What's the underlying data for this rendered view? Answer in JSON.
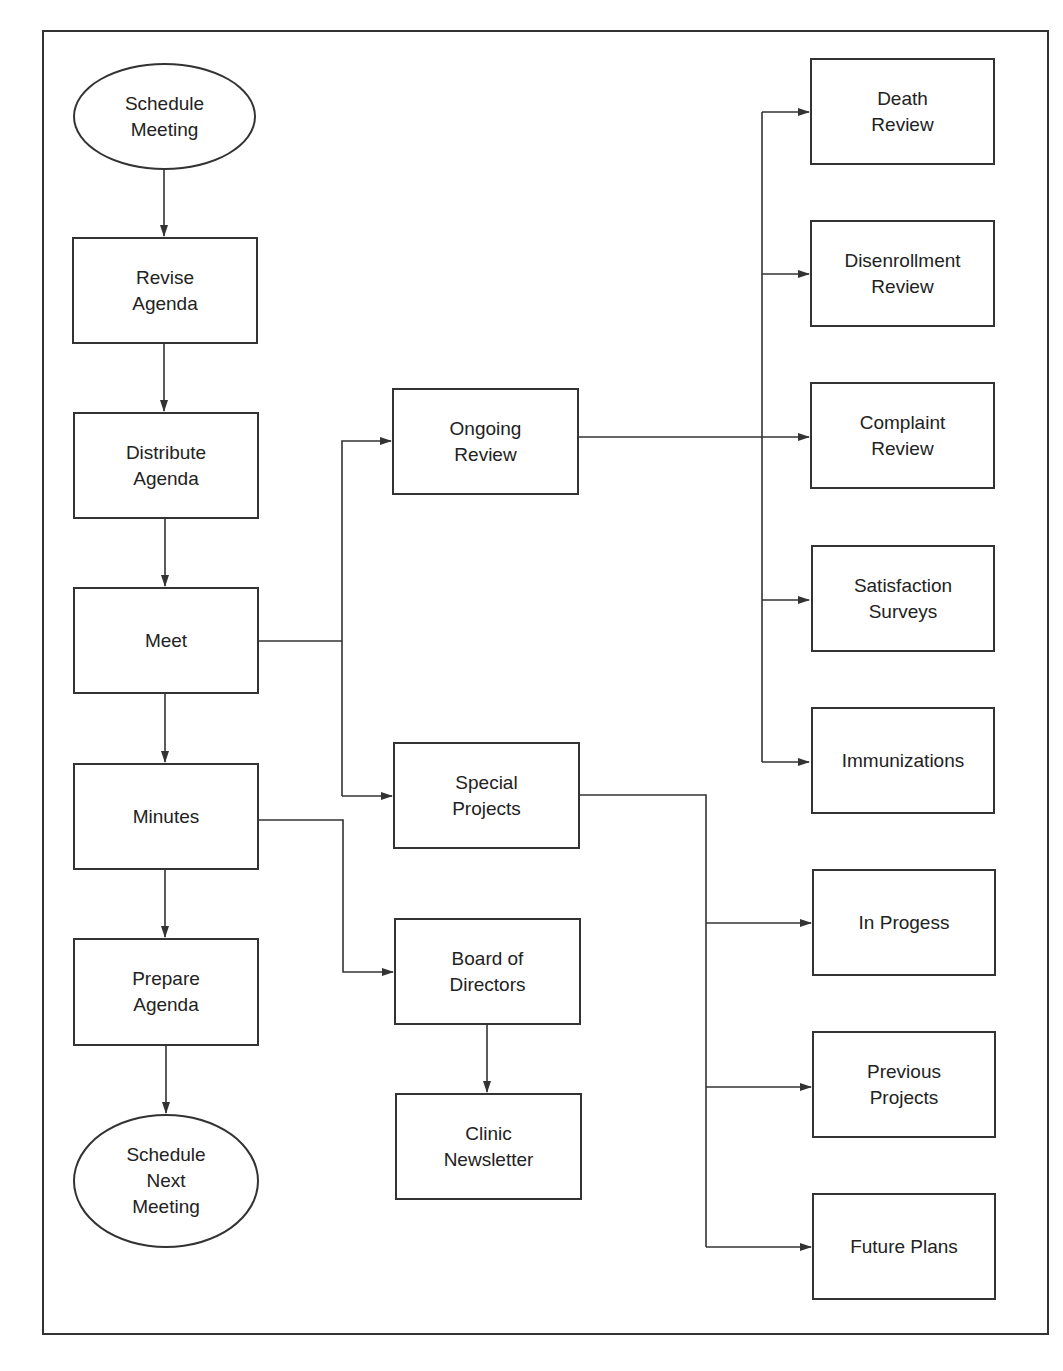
{
  "diagram": {
    "type": "flowchart",
    "nodes": {
      "schedule_meeting": "Schedule\nMeeting",
      "revise_agenda": "Revise\nAgenda",
      "distribute_agenda": "Distribute\nAgenda",
      "meet": "Meet",
      "minutes": "Minutes",
      "prepare_agenda": "Prepare\nAgenda",
      "schedule_next_meeting": "Schedule\nNext\nMeeting",
      "ongoing_review": "Ongoing\nReview",
      "special_projects": "Special\nProjects",
      "board_of_directors": "Board of\nDirectors",
      "clinic_newsletter": "Clinic\nNewsletter",
      "death_review": "Death\nReview",
      "disenrollment_review": "Disenrollment\nReview",
      "complaint_review": "Complaint\nReview",
      "satisfaction_surveys": "Satisfaction\nSurveys",
      "immunizations": "Immunizations",
      "in_progess": "In Progess",
      "previous_projects": "Previous\nProjects",
      "future_plans": "Future Plans"
    },
    "edges": [
      [
        "Schedule Meeting",
        "Revise Agenda"
      ],
      [
        "Revise Agenda",
        "Distribute Agenda"
      ],
      [
        "Distribute Agenda",
        "Meet"
      ],
      [
        "Meet",
        "Minutes"
      ],
      [
        "Minutes",
        "Prepare Agenda"
      ],
      [
        "Prepare Agenda",
        "Schedule Next Meeting"
      ],
      [
        "Meet",
        "Ongoing Review"
      ],
      [
        "Meet",
        "Special Projects"
      ],
      [
        "Minutes",
        "Board of Directors"
      ],
      [
        "Board of Directors",
        "Clinic Newsletter"
      ],
      [
        "Ongoing Review",
        "Death Review"
      ],
      [
        "Ongoing Review",
        "Disenrollment Review"
      ],
      [
        "Ongoing Review",
        "Complaint Review"
      ],
      [
        "Ongoing Review",
        "Satisfaction Surveys"
      ],
      [
        "Ongoing Review",
        "Immunizations"
      ],
      [
        "Special Projects",
        "In Progess"
      ],
      [
        "Special Projects",
        "Previous Projects"
      ],
      [
        "Special Projects",
        "Future Plans"
      ]
    ],
    "colors": {
      "line": "#333333",
      "background": "#ffffff",
      "text": "#222222"
    }
  }
}
